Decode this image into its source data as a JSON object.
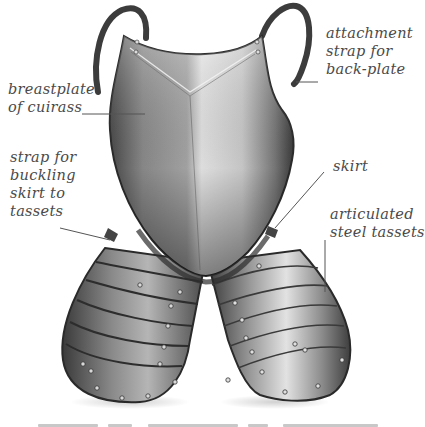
{
  "figure": {
    "colors": {
      "background": "#ffffff",
      "label_text": "#4a4a4a",
      "leader_line": "#555555",
      "steel_dark": "#3a3a3a",
      "steel_mid": "#8a8a8a",
      "steel_light": "#e6e6e6",
      "strap": "#3c3c3c"
    }
  },
  "labels": {
    "breastplate": {
      "lines": [
        "breastplate",
        "of cuirass"
      ]
    },
    "attachment_strap": {
      "lines": [
        "attachment",
        "strap for",
        "back-plate"
      ]
    },
    "buckling_strap": {
      "lines": [
        "strap for",
        "buckling",
        "skirt to",
        "tassets"
      ]
    },
    "skirt": {
      "lines": [
        "skirt"
      ]
    },
    "tassets": {
      "lines": [
        "articulated",
        "steel tassets"
      ]
    }
  },
  "caption_cut_off": {
    "visible": "partially cut off at bottom edge, illegible"
  }
}
